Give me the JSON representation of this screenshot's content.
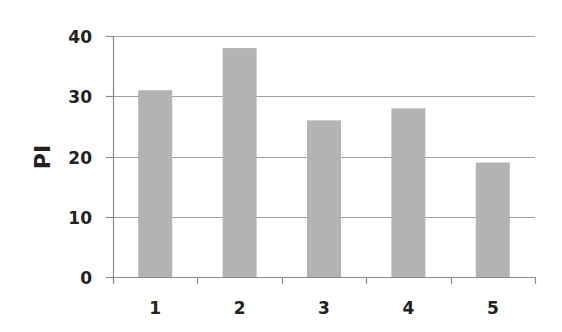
{
  "chart_data": {
    "type": "bar",
    "title": "",
    "xlabel": "",
    "ylabel": "PI",
    "categories": [
      "1",
      "2",
      "3",
      "4",
      "5"
    ],
    "values": [
      31,
      38,
      26,
      28,
      19
    ],
    "ylim": [
      0,
      40
    ],
    "yticks": [
      0,
      10,
      20,
      30,
      40
    ],
    "grid": true,
    "legend": null,
    "colors": {
      "bar": "#b3b3b3",
      "grid": "#a0a0a0",
      "axis": "#8c8c8c",
      "text": "#222222"
    }
  }
}
